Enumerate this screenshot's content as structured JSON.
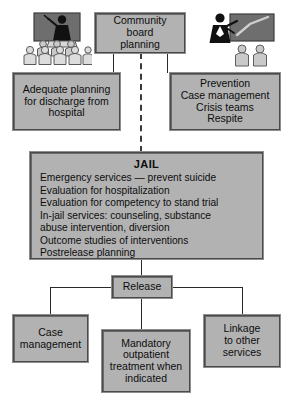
{
  "diagram": {
    "colors": {
      "box_fill": "#b2b2b2",
      "box_border": "#4a4a4a",
      "line": "#2b2b2b",
      "text": "#0d0d0d"
    }
  },
  "nodes": {
    "community_board": {
      "label": "Community board\nplanning"
    },
    "adequate_planning": {
      "label": "Adequate planning\nfor discharge from\nhospital"
    },
    "prevention": {
      "label": "Prevention\nCase management\nCrisis teams\nRespite"
    },
    "jail": {
      "title": "JAIL",
      "body": "Emergency services — prevent suicide\nEvaluation for hospitalization\nEvaluation for competency to stand trial\nIn-jail services: counseling, substance\n    abuse intervention, diversion\nOutcome studies of interventions\nPostrelease planning"
    },
    "release": {
      "label": "Release"
    },
    "case_management": {
      "label": "Case\nmanagement"
    },
    "mandatory_outpatient": {
      "label": "Mandatory\noutpatient\ntreatment when\nindicated"
    },
    "linkage": {
      "label": "Linkage\nto other\nservices"
    }
  },
  "illustrations": {
    "left": {
      "name": "classroom-presentation-illustration"
    },
    "right": {
      "name": "presenter-with-checkmark-board-illustration"
    }
  }
}
